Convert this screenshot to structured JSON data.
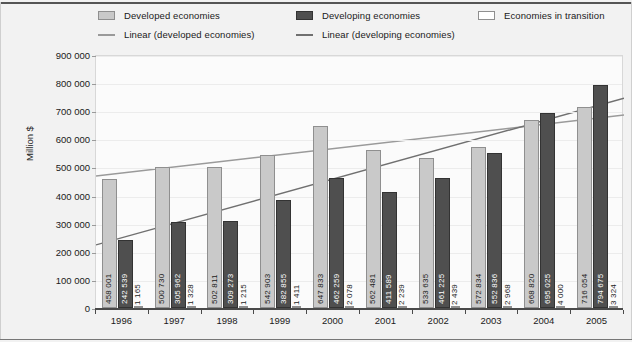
{
  "chart_data": {
    "type": "bar",
    "title": "",
    "subtitle": "",
    "xlabel": "",
    "ylabel": "Million $",
    "ylim": [
      0,
      900000
    ],
    "ytick_step": 100000,
    "grid": true,
    "legend_position": "top",
    "categories": [
      "1996",
      "1997",
      "1998",
      "1999",
      "2000",
      "2001",
      "2002",
      "2003",
      "2004",
      "2005"
    ],
    "ytick_labels": [
      "900 000",
      "800 000",
      "700 000",
      "600 000",
      "500 000",
      "400 000",
      "300 000",
      "200 000",
      "100 000",
      "0"
    ],
    "ytick_values": [
      900000,
      800000,
      700000,
      600000,
      500000,
      400000,
      300000,
      200000,
      100000,
      0
    ],
    "series": [
      {
        "name": "Developed economies",
        "color": "#c9c9c9",
        "values": [
          458001,
          500730,
          502811,
          542903,
          647833,
          562481,
          533635,
          572834,
          668820,
          716054
        ],
        "labels": [
          "458 001",
          "500 730",
          "502 811",
          "542 903",
          "647 833",
          "562 481",
          "533 635",
          "572 834",
          "668 820",
          "716 054"
        ]
      },
      {
        "name": "Developing economies",
        "color": "#4f4f4f",
        "values": [
          242539,
          305962,
          309273,
          382855,
          462259,
          411589,
          461225,
          552836,
          695025,
          794675
        ],
        "labels": [
          "242 539",
          "305 962",
          "309 273",
          "382 855",
          "462 259",
          "411 589",
          "461 225",
          "552 836",
          "695 025",
          "794 675"
        ]
      },
      {
        "name": "Economies in transition",
        "color": "#ffffff",
        "values": [
          1165,
          1328,
          1215,
          1411,
          2078,
          2239,
          2439,
          2968,
          4000,
          3324
        ],
        "labels": [
          "1 165",
          "1 328",
          "1 215",
          "1 411",
          "2 078",
          "2 239",
          "2 439",
          "2 968",
          "4 000",
          "3 324"
        ]
      }
    ],
    "trendlines": [
      {
        "name": "Linear (developed economies)",
        "color": "#9a9a9a",
        "start_value": 473000,
        "end_value": 690000
      },
      {
        "name": "Linear (developing economies)",
        "color": "#707070",
        "start_value": 228000,
        "end_value": 750000
      }
    ]
  },
  "legend": {
    "items": [
      {
        "label": "Developed economies",
        "marker": "swatch",
        "color": "#c9c9c9"
      },
      {
        "label": "Developing economies",
        "marker": "swatch",
        "color": "#4f4f4f"
      },
      {
        "label": "Economies in transition",
        "marker": "swatch",
        "color": "#ffffff"
      },
      {
        "label": "Linear (developed economies)",
        "marker": "line",
        "color": "#9a9a9a"
      },
      {
        "label": "Linear (developing economies)",
        "marker": "line",
        "color": "#707070"
      }
    ]
  }
}
